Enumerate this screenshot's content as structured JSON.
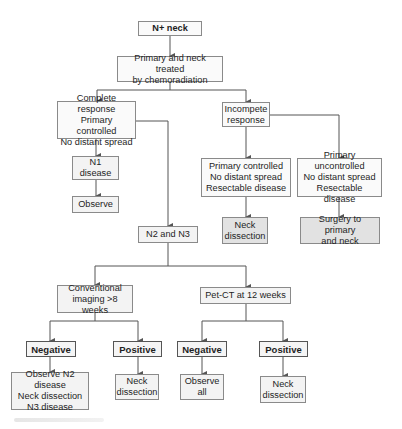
{
  "diagram": {
    "type": "flowchart",
    "title_node": "N+ neck",
    "nodes": {
      "n_plus_neck": "N+ neck",
      "chemoradiation": "Primary and neck treated\nby chemoradiation",
      "complete_response": "Complete response\nPrimary controlled\nNo distant spread",
      "incomplete_response": "Incompete\nresponse",
      "n1_disease": "N1\ndisease",
      "observe": "Observe",
      "primary_controlled": "Primary controlled\nNo distant spread\nResectable disease",
      "primary_uncontrolled": "Primary uncontrolled\nNo distant spread\nResectable disease",
      "neck_dissection_1": "Neck\ndissection",
      "surgery_primary_neck": "Surgery to primary\nand neck",
      "n2_n3": "N2 and N3",
      "conventional_imaging": "Conventional\nimaging >8 weeks",
      "pet_ct": "Pet-CT at 12 weeks",
      "negative_conv": "Negative",
      "positive_conv": "Positive",
      "negative_pet": "Negative",
      "positive_pet": "Positive",
      "observe_n2": "Observe N2 disease\nNeck dissection\nN3 disease",
      "neck_dissection_2": "Neck\ndissection",
      "observe_all": "Observe\nall",
      "neck_dissection_3": "Neck\ndissection"
    },
    "edges": [
      [
        "n_plus_neck",
        "chemoradiation"
      ],
      [
        "chemoradiation",
        "complete_response"
      ],
      [
        "chemoradiation",
        "incomplete_response"
      ],
      [
        "complete_response",
        "n1_disease"
      ],
      [
        "n1_disease",
        "observe"
      ],
      [
        "complete_response",
        "n2_n3"
      ],
      [
        "incomplete_response",
        "primary_controlled"
      ],
      [
        "incomplete_response",
        "primary_uncontrolled"
      ],
      [
        "primary_controlled",
        "neck_dissection_1"
      ],
      [
        "primary_uncontrolled",
        "surgery_primary_neck"
      ],
      [
        "n2_n3",
        "conventional_imaging"
      ],
      [
        "n2_n3",
        "pet_ct"
      ],
      [
        "conventional_imaging",
        "negative_conv"
      ],
      [
        "conventional_imaging",
        "positive_conv"
      ],
      [
        "pet_ct",
        "negative_pet"
      ],
      [
        "pet_ct",
        "positive_pet"
      ],
      [
        "negative_conv",
        "observe_n2"
      ],
      [
        "positive_conv",
        "neck_dissection_2"
      ],
      [
        "negative_pet",
        "observe_all"
      ],
      [
        "positive_pet",
        "neck_dissection_3"
      ]
    ],
    "colors": {
      "line": "#555555",
      "box_border": "#8a8a8a",
      "box_fill": "#f3f3f3",
      "terminal_fill": "#e2e2e2"
    }
  }
}
